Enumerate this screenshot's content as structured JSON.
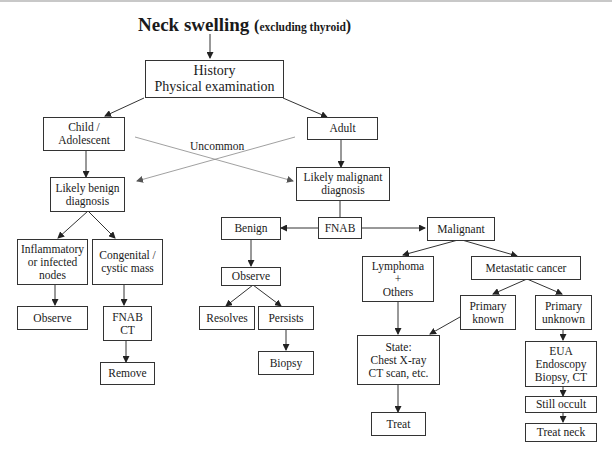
{
  "title": {
    "main": "Neck swelling",
    "open_paren": "(",
    "sub": "excluding thyroid",
    "close_paren": ")"
  },
  "nodes": {
    "history": [
      "History",
      "Physical examination"
    ],
    "child": [
      "Child /",
      "Adolescent"
    ],
    "adult": [
      "Adult"
    ],
    "likely_benign": [
      "Likely benign",
      "diagnosis"
    ],
    "likely_malignant": [
      "Likely malignant",
      "diagnosis"
    ],
    "inflammatory": [
      "Inflammatory",
      "or infected",
      "nodes"
    ],
    "congenital": [
      "Congenital /",
      "cystic mass"
    ],
    "observe_left": [
      "Observe"
    ],
    "fnab_ct": [
      "FNAB",
      "CT"
    ],
    "remove": [
      "Remove"
    ],
    "fnab": [
      "FNAB"
    ],
    "benign": [
      "Benign"
    ],
    "malignant": [
      "Malignant"
    ],
    "observe_mid": [
      "Observe"
    ],
    "resolves": [
      "Resolves"
    ],
    "persists": [
      "Persists"
    ],
    "biopsy": [
      "Biopsy"
    ],
    "lymphoma": [
      "Lymphoma",
      "+",
      "Others"
    ],
    "metastatic": [
      "Metastatic cancer"
    ],
    "primary_known": [
      "Primary",
      "known"
    ],
    "primary_unknown": [
      "Primary",
      "unknown"
    ],
    "state": [
      "State:",
      "Chest X-ray",
      "CT scan, etc."
    ],
    "treat": [
      "Treat"
    ],
    "eua": [
      "EUA",
      "Endoscopy",
      "Biopsy, CT"
    ],
    "still_occult": [
      "Still occult"
    ],
    "treat_neck": [
      "Treat neck"
    ]
  },
  "edge_labels": {
    "uncommon": "Uncommon"
  },
  "colors": {
    "line": "#333333",
    "cross_line": "#888888",
    "top_rule": "#c8c8c8"
  }
}
